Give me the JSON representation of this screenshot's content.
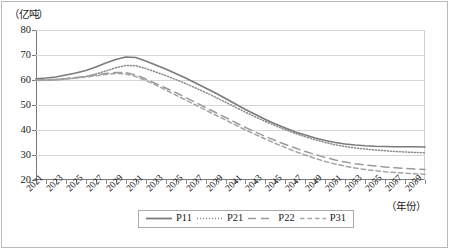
{
  "chart_data": {
    "type": "line",
    "title": "",
    "xlabel": "（年份）",
    "ylabel": "（亿吨）",
    "ylim": [
      20,
      80
    ],
    "y_ticks": [
      20,
      30,
      40,
      50,
      60,
      70,
      80
    ],
    "xlim": [
      2021,
      2060
    ],
    "grid": true,
    "legend_position": "bottom",
    "x": [
      2021,
      2022,
      2023,
      2024,
      2025,
      2026,
      2027,
      2028,
      2029,
      2030,
      2031,
      2032,
      2033,
      2034,
      2035,
      2036,
      2037,
      2038,
      2039,
      2040,
      2041,
      2042,
      2043,
      2044,
      2045,
      2046,
      2047,
      2048,
      2049,
      2050,
      2051,
      2052,
      2053,
      2054,
      2055,
      2056,
      2057,
      2058,
      2059,
      2060
    ],
    "x_tick_labels": [
      "2021",
      "2023",
      "2025",
      "2027",
      "2029",
      "2031",
      "2033",
      "2035",
      "2037",
      "2039",
      "2041",
      "2043",
      "2045",
      "2047",
      "2049",
      "2051",
      "2053",
      "2055",
      "2057",
      "2059"
    ],
    "series": [
      {
        "name": "P11",
        "style": "solid",
        "color": "#7b7b7b",
        "values": [
          60.5,
          60.8,
          61.2,
          62.0,
          62.8,
          63.8,
          65.2,
          66.8,
          68.2,
          69.2,
          69.0,
          67.6,
          66.0,
          64.4,
          62.6,
          60.8,
          58.8,
          56.8,
          54.8,
          52.6,
          50.4,
          48.2,
          46.2,
          44.2,
          42.4,
          40.8,
          39.2,
          38.0,
          36.8,
          35.8,
          35.0,
          34.4,
          34.0,
          33.7,
          33.5,
          33.4,
          33.3,
          33.3,
          33.3,
          33.2
        ]
      },
      {
        "name": "P21",
        "style": "dotted",
        "color": "#8a8a8a",
        "values": [
          59.8,
          59.9,
          60.0,
          60.4,
          60.8,
          61.4,
          62.4,
          63.6,
          64.9,
          65.8,
          65.7,
          64.6,
          63.2,
          61.8,
          60.2,
          58.6,
          56.8,
          55.0,
          53.1,
          51.1,
          49.1,
          47.1,
          45.2,
          43.4,
          41.7,
          40.1,
          38.6,
          37.3,
          36.1,
          35.0,
          34.1,
          33.4,
          32.8,
          32.4,
          32.0,
          31.7,
          31.4,
          31.2,
          31.0,
          30.9
        ]
      },
      {
        "name": "P22",
        "style": "dashed-long",
        "color": "#9a9a9a",
        "values": [
          60.0,
          60.1,
          60.3,
          60.6,
          61.0,
          61.4,
          62.0,
          62.6,
          63.0,
          63.0,
          62.0,
          60.4,
          58.6,
          56.8,
          55.0,
          53.0,
          51.0,
          49.0,
          47.0,
          45.0,
          43.0,
          41.0,
          39.2,
          37.4,
          35.8,
          34.2,
          32.8,
          31.4,
          30.2,
          29.0,
          28.0,
          27.2,
          26.5,
          26.0,
          25.6,
          25.2,
          24.9,
          24.6,
          24.4,
          24.2
        ]
      },
      {
        "name": "P31",
        "style": "dashed-short",
        "color": "#a5a5a5",
        "values": [
          59.9,
          60.0,
          60.2,
          60.5,
          60.8,
          61.2,
          61.7,
          62.2,
          62.6,
          62.4,
          61.4,
          59.8,
          58.0,
          56.0,
          54.0,
          52.0,
          50.0,
          48.0,
          46.0,
          44.0,
          42.0,
          40.0,
          38.2,
          36.4,
          34.6,
          33.0,
          31.4,
          30.0,
          28.6,
          27.4,
          26.4,
          25.5,
          24.8,
          24.2,
          23.7,
          23.3,
          23.0,
          22.7,
          22.5,
          22.3
        ]
      }
    ]
  }
}
